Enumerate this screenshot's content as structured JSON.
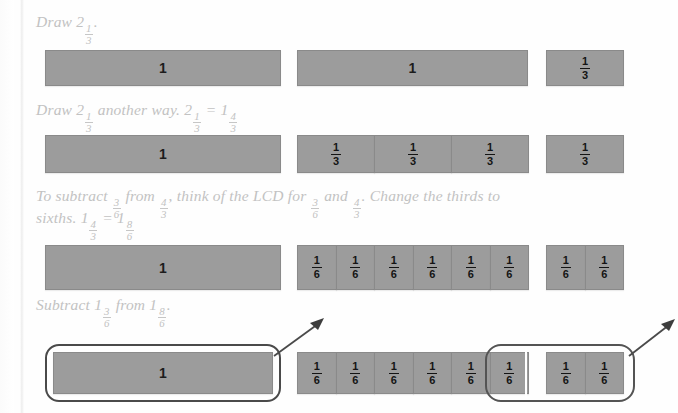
{
  "page": {
    "bar_fill_color": "#9c9c9c",
    "bar_border_color": "#8a8a8a",
    "caption_color": "#c2c2c2",
    "loop_color": "#545454",
    "background_color": "#ffffff"
  },
  "rows": [
    {
      "id": "row-1",
      "caption": {
        "prefix": "Draw 2",
        "fraction": {
          "numerator": "1",
          "denominator": "3"
        },
        "suffix": "."
      },
      "whole_bars": [
        {
          "label": "1"
        },
        {
          "label": "1"
        }
      ],
      "part_groups": [
        {
          "count": 1,
          "numerator": "1",
          "denominator": "3"
        }
      ]
    },
    {
      "id": "row-2",
      "caption": {
        "prefix": "Draw 2",
        "fraction": {
          "numerator": "1",
          "denominator": "3"
        },
        "middle": "another way. 2",
        "fraction2": {
          "numerator": "1",
          "denominator": "3"
        },
        "equals": "=",
        "whole2": "1",
        "fraction3": {
          "numerator": "4",
          "denominator": "3"
        }
      },
      "whole_bars": [
        {
          "label": "1"
        }
      ],
      "part_groups": [
        {
          "count": 3,
          "numerator": "1",
          "denominator": "3"
        },
        {
          "count": 1,
          "numerator": "1",
          "denominator": "3"
        }
      ]
    },
    {
      "id": "row-3",
      "caption_line_1": {
        "t1": "To subtract",
        "f1": {
          "numerator": "3",
          "denominator": "6"
        },
        "t2": "from",
        "f2": {
          "numerator": "4",
          "denominator": "3"
        },
        "t3": ", think of the LCD for",
        "f3": {
          "numerator": "3",
          "denominator": "6"
        },
        "t4": "and",
        "f4": {
          "numerator": "4",
          "denominator": "3"
        },
        "t5": ". Change the thirds to"
      },
      "caption_line_2": {
        "t1": "sixths.",
        "w1": "1",
        "f1": {
          "numerator": "4",
          "denominator": "3"
        },
        "eq": "=",
        "w2": "1",
        "f2": {
          "numerator": "8",
          "denominator": "6"
        }
      },
      "whole_bars": [
        {
          "label": "1"
        }
      ],
      "part_groups": [
        {
          "count": 6,
          "numerator": "1",
          "denominator": "6"
        },
        {
          "count": 2,
          "numerator": "1",
          "denominator": "6"
        }
      ]
    },
    {
      "id": "row-4",
      "caption": {
        "t1": "Subtract",
        "w1": "1",
        "f1": {
          "numerator": "3",
          "denominator": "6"
        },
        "t2": "from",
        "w2": "1",
        "f2": {
          "numerator": "8",
          "denominator": "6"
        },
        "t3": "."
      },
      "whole_bars": [
        {
          "label": "1"
        }
      ],
      "part_groups": [
        {
          "count": 6,
          "numerator": "1",
          "denominator": "6"
        },
        {
          "count": 2,
          "numerator": "1",
          "denominator": "6"
        }
      ],
      "annotations": [
        {
          "name": "loop-whole-bar",
          "arrow": "up-right"
        },
        {
          "name": "loop-three-sixths",
          "arrow": "up-right"
        }
      ]
    }
  ]
}
